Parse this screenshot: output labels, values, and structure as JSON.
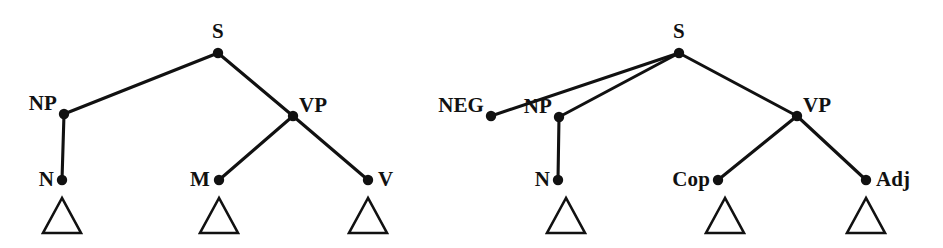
{
  "figure": {
    "background_color": "#ffffff",
    "ink_color": "#111111",
    "width": 943,
    "height": 248,
    "caption": ""
  },
  "diagram_data": {
    "type": "syntax-tree-pair",
    "notation": "phrase structure tree with triangle abbreviations",
    "trees": [
      {
        "id": "tree-left",
        "name": "left-tree",
        "root": "S",
        "nodes": [
          {
            "id": "L-S",
            "label": "S",
            "x": 218,
            "y": 53,
            "label_x": 218,
            "label_y": 38,
            "anchor": "middle",
            "dot": true
          },
          {
            "id": "L-NP",
            "label": "NP",
            "x": 64,
            "y": 114,
            "label_x": 57,
            "label_y": 110,
            "anchor": "end",
            "dot": true
          },
          {
            "id": "L-VP",
            "label": "VP",
            "x": 293,
            "y": 116,
            "label_x": 299,
            "label_y": 112,
            "anchor": "start",
            "dot": true
          },
          {
            "id": "L-N",
            "label": "N",
            "x": 62,
            "y": 180,
            "label_x": 54,
            "label_y": 186,
            "anchor": "end",
            "dot": true
          },
          {
            "id": "L-M",
            "label": "M",
            "x": 219,
            "y": 180,
            "label_x": 210,
            "label_y": 186,
            "anchor": "end",
            "dot": true
          },
          {
            "id": "L-V",
            "label": "V",
            "x": 368,
            "y": 180,
            "label_x": 378,
            "label_y": 186,
            "anchor": "start",
            "dot": true
          }
        ],
        "edges": [
          {
            "from": "L-S",
            "to": "L-NP"
          },
          {
            "from": "L-S",
            "to": "L-VP"
          },
          {
            "from": "L-NP",
            "to": "L-N"
          },
          {
            "from": "L-VP",
            "to": "L-M"
          },
          {
            "from": "L-VP",
            "to": "L-V"
          }
        ],
        "triangles": [
          {
            "id": "L-tri-N",
            "under": "L-N",
            "cx": 62,
            "top_y": 198,
            "base_y": 233,
            "half_width": 19
          },
          {
            "id": "L-tri-M",
            "under": "L-M",
            "cx": 219,
            "top_y": 198,
            "base_y": 233,
            "half_width": 19
          },
          {
            "id": "L-tri-V",
            "under": "L-V",
            "cx": 368,
            "top_y": 198,
            "base_y": 233,
            "half_width": 19
          }
        ]
      },
      {
        "id": "tree-right",
        "name": "right-tree",
        "root": "S",
        "nodes": [
          {
            "id": "R-S",
            "label": "S",
            "x": 679,
            "y": 53,
            "label_x": 679,
            "label_y": 38,
            "anchor": "middle",
            "dot": true
          },
          {
            "id": "R-NEG",
            "label": "NEG",
            "x": 491,
            "y": 116,
            "label_x": 484,
            "label_y": 112,
            "anchor": "end",
            "dot": true
          },
          {
            "id": "R-NP",
            "label": "NP",
            "x": 559,
            "y": 117,
            "label_x": 552,
            "label_y": 113,
            "anchor": "end",
            "dot": true
          },
          {
            "id": "R-VP",
            "label": "VP",
            "x": 797,
            "y": 116,
            "label_x": 803,
            "label_y": 112,
            "anchor": "start",
            "dot": true
          },
          {
            "id": "R-N",
            "label": "N",
            "x": 558,
            "y": 180,
            "label_x": 550,
            "label_y": 186,
            "anchor": "end",
            "dot": true
          },
          {
            "id": "R-Cop",
            "label": "Cop",
            "x": 718,
            "y": 180,
            "label_x": 710,
            "label_y": 186,
            "anchor": "end",
            "dot": true
          },
          {
            "id": "R-Adj",
            "label": "Adj",
            "x": 866,
            "y": 180,
            "label_x": 876,
            "label_y": 186,
            "anchor": "start",
            "dot": true
          }
        ],
        "edges": [
          {
            "from": "R-S",
            "to": "R-NEG"
          },
          {
            "from": "R-S",
            "to": "R-NP"
          },
          {
            "from": "R-S",
            "to": "R-VP"
          },
          {
            "from": "R-NP",
            "to": "R-N"
          },
          {
            "from": "R-VP",
            "to": "R-Cop"
          },
          {
            "from": "R-VP",
            "to": "R-Adj"
          }
        ],
        "triangles": [
          {
            "id": "R-tri-N",
            "under": "R-N",
            "cx": 566,
            "top_y": 198,
            "base_y": 233,
            "half_width": 19
          },
          {
            "id": "R-tri-Cop",
            "under": "R-Cop",
            "cx": 725,
            "top_y": 198,
            "base_y": 233,
            "half_width": 19
          },
          {
            "id": "R-tri-Adj",
            "under": "R-Adj",
            "cx": 866,
            "top_y": 198,
            "base_y": 233,
            "half_width": 19
          }
        ]
      }
    ],
    "all_labels": [
      "S",
      "NP",
      "VP",
      "N",
      "M",
      "V",
      "NEG",
      "Cop",
      "Adj"
    ]
  }
}
